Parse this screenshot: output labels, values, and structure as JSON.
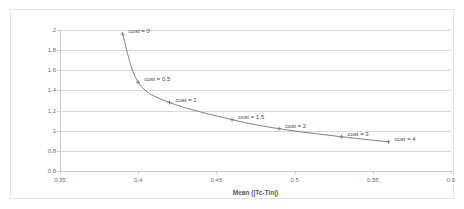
{
  "chart_data": {
    "type": "line",
    "title": "",
    "subtitle": "",
    "xlabel": "Mean (|Tc-Tin|)",
    "ylabel": "Mean ventilation use in ach",
    "xlim": [
      0.35,
      0.6
    ],
    "ylim": [
      0.6,
      2.0
    ],
    "xticks": [
      "0.35",
      "0.4",
      "0.45",
      "0.5",
      "0.55",
      "0.6"
    ],
    "xtick_values": [
      0.35,
      0.4,
      0.45,
      0.5,
      0.55,
      0.6
    ],
    "yticks": [
      "0.6",
      "0.8",
      "1",
      "1.2",
      "1.4",
      "1.6",
      "1.8",
      "2"
    ],
    "ytick_values": [
      0.6,
      0.8,
      1.0,
      1.2,
      1.4,
      1.6,
      1.8,
      2.0
    ],
    "grid": "horizontal",
    "legend": "none",
    "line_color": "#808080",
    "marker": "cross",
    "marker_color": "#808080",
    "series": [
      {
        "name": "Pareto front",
        "x": [
          0.39,
          0.4,
          0.42,
          0.46,
          0.49,
          0.53,
          0.56
        ],
        "y": [
          1.96,
          1.48,
          1.28,
          1.11,
          1.02,
          0.94,
          0.89
        ],
        "point_labels": [
          "cost = 0",
          "cost = 0.5",
          "cost = 1",
          "cost = 1.5",
          "cost = 2",
          "cost = 3",
          "cost = 4"
        ]
      }
    ],
    "annotations": [
      {
        "text": "cost = 0",
        "x": 0.39,
        "y": 1.96
      },
      {
        "text": "cost = 0.5",
        "x": 0.4,
        "y": 1.48
      },
      {
        "text": "cost = 1",
        "x": 0.42,
        "y": 1.28
      },
      {
        "text": "cost = 1.5",
        "x": 0.46,
        "y": 1.11
      },
      {
        "text": "cost = 2",
        "x": 0.49,
        "y": 1.02
      },
      {
        "text": "cost = 3",
        "x": 0.53,
        "y": 0.94
      },
      {
        "text": "cost = 4",
        "x": 0.56,
        "y": 0.89
      }
    ]
  }
}
